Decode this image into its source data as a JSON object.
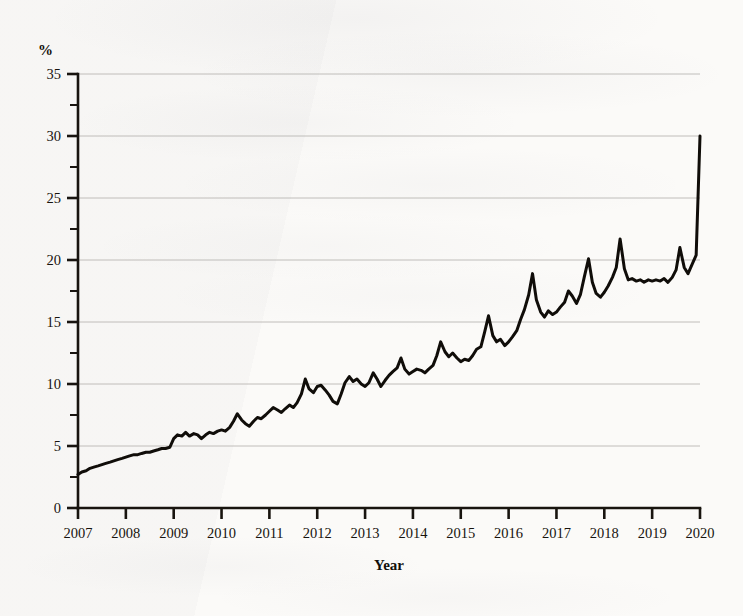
{
  "figure": {
    "background_color": "#fbfaf8",
    "ink_color": "#100d09",
    "gridline_color": "#b9b7b3"
  },
  "axes": {
    "y_title": "%",
    "x_title": "Year"
  },
  "chart_data": {
    "type": "line",
    "title": "",
    "xlabel": "Year",
    "ylabel": "%",
    "xlim": [
      2007,
      2020
    ],
    "ylim": [
      0,
      35
    ],
    "grid": true,
    "legend": "none",
    "y_ticks": [
      0,
      5,
      10,
      15,
      20,
      25,
      30,
      35
    ],
    "y_tick_labels": [
      "0",
      "5",
      "10",
      "15",
      "20",
      "25",
      "30",
      "35"
    ],
    "y_minor_ticks": [
      2.5,
      7.5,
      12.5,
      17.5,
      22.5,
      27.5,
      32.5
    ],
    "x_ticks": [
      2007,
      2008,
      2009,
      2010,
      2011,
      2012,
      2013,
      2014,
      2015,
      2016,
      2017,
      2018,
      2019,
      2020
    ],
    "x_tick_labels": [
      "2007",
      "2008",
      "2009",
      "2010",
      "2011",
      "2012",
      "2013",
      "2014",
      "2015",
      "2016",
      "2017",
      "2018",
      "2019",
      "2020"
    ],
    "series": [
      {
        "name": "percent",
        "color": "#100d09",
        "x": [
          2007.0,
          2007.08,
          2007.17,
          2007.25,
          2007.33,
          2007.42,
          2007.5,
          2007.58,
          2007.67,
          2007.75,
          2007.83,
          2007.92,
          2008.0,
          2008.08,
          2008.17,
          2008.25,
          2008.33,
          2008.42,
          2008.5,
          2008.58,
          2008.67,
          2008.75,
          2008.83,
          2008.92,
          2009.0,
          2009.08,
          2009.17,
          2009.25,
          2009.33,
          2009.42,
          2009.5,
          2009.58,
          2009.67,
          2009.75,
          2009.83,
          2009.92,
          2010.0,
          2010.08,
          2010.17,
          2010.25,
          2010.33,
          2010.42,
          2010.5,
          2010.58,
          2010.67,
          2010.75,
          2010.83,
          2010.92,
          2011.0,
          2011.08,
          2011.17,
          2011.25,
          2011.33,
          2011.42,
          2011.5,
          2011.58,
          2011.67,
          2011.75,
          2011.83,
          2011.92,
          2012.0,
          2012.08,
          2012.17,
          2012.25,
          2012.33,
          2012.42,
          2012.5,
          2012.58,
          2012.67,
          2012.75,
          2012.83,
          2012.92,
          2013.0,
          2013.08,
          2013.17,
          2013.25,
          2013.33,
          2013.42,
          2013.5,
          2013.58,
          2013.67,
          2013.75,
          2013.83,
          2013.92,
          2014.0,
          2014.08,
          2014.17,
          2014.25,
          2014.33,
          2014.42,
          2014.5,
          2014.58,
          2014.67,
          2014.75,
          2014.83,
          2014.92,
          2015.0,
          2015.08,
          2015.17,
          2015.25,
          2015.33,
          2015.42,
          2015.5,
          2015.58,
          2015.67,
          2015.75,
          2015.83,
          2015.92,
          2016.0,
          2016.08,
          2016.17,
          2016.25,
          2016.33,
          2016.42,
          2016.5,
          2016.58,
          2016.67,
          2016.75,
          2016.83,
          2016.92,
          2017.0,
          2017.08,
          2017.17,
          2017.25,
          2017.33,
          2017.42,
          2017.5,
          2017.58,
          2017.67,
          2017.75,
          2017.83,
          2017.92,
          2018.0,
          2018.08,
          2018.17,
          2018.25,
          2018.33,
          2018.42,
          2018.5,
          2018.58,
          2018.67,
          2018.75,
          2018.83,
          2018.92,
          2019.0,
          2019.08,
          2019.17,
          2019.25,
          2019.33,
          2019.42,
          2019.5,
          2019.58,
          2019.67,
          2019.75,
          2019.83,
          2019.92,
          2020.0
        ],
        "values": [
          2.7,
          2.9,
          3.0,
          3.2,
          3.3,
          3.4,
          3.5,
          3.6,
          3.7,
          3.8,
          3.9,
          4.0,
          4.1,
          4.2,
          4.3,
          4.3,
          4.4,
          4.5,
          4.5,
          4.6,
          4.7,
          4.8,
          4.8,
          4.9,
          5.6,
          5.9,
          5.8,
          6.1,
          5.8,
          6.0,
          5.9,
          5.6,
          5.9,
          6.1,
          6.0,
          6.2,
          6.3,
          6.2,
          6.5,
          7.0,
          7.6,
          7.1,
          6.8,
          6.6,
          7.0,
          7.3,
          7.2,
          7.5,
          7.8,
          8.1,
          7.9,
          7.7,
          8.0,
          8.3,
          8.1,
          8.5,
          9.2,
          10.4,
          9.6,
          9.3,
          9.8,
          9.9,
          9.5,
          9.1,
          8.6,
          8.4,
          9.2,
          10.1,
          10.6,
          10.2,
          10.4,
          10.0,
          9.8,
          10.1,
          10.9,
          10.4,
          9.8,
          10.3,
          10.7,
          11.0,
          11.3,
          12.1,
          11.2,
          10.8,
          11.0,
          11.2,
          11.1,
          10.9,
          11.2,
          11.5,
          12.3,
          13.4,
          12.6,
          12.2,
          12.5,
          12.1,
          11.8,
          12.0,
          11.9,
          12.3,
          12.8,
          13.0,
          14.2,
          15.5,
          13.9,
          13.4,
          13.6,
          13.1,
          13.4,
          13.8,
          14.3,
          15.2,
          16.0,
          17.2,
          18.9,
          16.8,
          15.8,
          15.4,
          15.9,
          15.6,
          15.8,
          16.2,
          16.6,
          17.5,
          17.1,
          16.5,
          17.2,
          18.6,
          20.1,
          18.2,
          17.3,
          17.0,
          17.4,
          17.9,
          18.6,
          19.4,
          21.7,
          19.3,
          18.4,
          18.5,
          18.3,
          18.4,
          18.2,
          18.4,
          18.3,
          18.4,
          18.3,
          18.5,
          18.2,
          18.6,
          19.2,
          21.0,
          19.4,
          18.9,
          19.6,
          20.4,
          30.0
        ]
      }
    ],
    "annotations": [
      {
        "text": "final observation rises vertically to 30%",
        "x": 2020,
        "y": 30
      }
    ]
  }
}
